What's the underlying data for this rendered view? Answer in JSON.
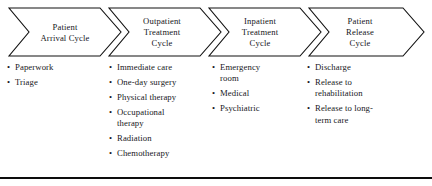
{
  "diagram": {
    "type": "process-chevron",
    "accent_color": "#111111",
    "background_color": "#ffffff",
    "stages": [
      {
        "id": "patient-arrival-cycle",
        "title_lines": [
          "Patient",
          "Arrival Cycle"
        ],
        "bullet_marker": "•",
        "items": [
          {
            "lines": [
              "Paperwork"
            ]
          },
          {
            "lines": [
              "Triage"
            ]
          }
        ]
      },
      {
        "id": "outpatient-treatment-cycle",
        "title_lines": [
          "Outpatient",
          "Treatment",
          "Cycle"
        ],
        "bullet_marker": "•",
        "items": [
          {
            "lines": [
              "Immediate care"
            ]
          },
          {
            "lines": [
              "One-day surgery"
            ]
          },
          {
            "lines": [
              "Physical therapy"
            ]
          },
          {
            "lines": [
              "Occupational",
              "therapy"
            ]
          },
          {
            "lines": [
              "Radiation"
            ]
          },
          {
            "lines": [
              "Chemotherapy"
            ]
          }
        ]
      },
      {
        "id": "inpatient-treatment-cycle",
        "title_lines": [
          "Inpatient",
          "Treatment",
          "Cycle"
        ],
        "bullet_marker": "•",
        "items": [
          {
            "lines": [
              "Emergency",
              "room"
            ]
          },
          {
            "lines": [
              "Medical"
            ]
          },
          {
            "lines": [
              "Psychiatric"
            ]
          }
        ]
      },
      {
        "id": "patient-release-cycle",
        "title_lines": [
          "Patient",
          "Release",
          "Cycle"
        ],
        "bullet_marker": "•",
        "items": [
          {
            "lines": [
              "Discharge"
            ]
          },
          {
            "lines": [
              "Release to",
              "rehabilitation"
            ]
          },
          {
            "lines": [
              "Release to long-",
              "term care"
            ]
          }
        ]
      }
    ]
  },
  "stage_titles": {
    "s1l1": "Patient",
    "s1l2": "Arrival Cycle",
    "s2l1": "Outpatient",
    "s2l2": "Treatment",
    "s2l3": "Cycle",
    "s3l1": "Inpatient",
    "s3l2": "Treatment",
    "s3l3": "Cycle",
    "s4l1": "Patient",
    "s4l2": "Release",
    "s4l3": "Cycle"
  },
  "bullets": {
    "marker": "•",
    "c1": [
      {
        "l1": "Paperwork",
        "l2": ""
      },
      {
        "l1": "Triage",
        "l2": ""
      }
    ],
    "c2": [
      {
        "l1": "Immediate care",
        "l2": ""
      },
      {
        "l1": "One-day surgery",
        "l2": ""
      },
      {
        "l1": "Physical therapy",
        "l2": ""
      },
      {
        "l1": "Occupational",
        "l2": "therapy"
      },
      {
        "l1": "Radiation",
        "l2": ""
      },
      {
        "l1": "Chemotherapy",
        "l2": ""
      }
    ],
    "c3": [
      {
        "l1": "Emergency",
        "l2": "room"
      },
      {
        "l1": "Medical",
        "l2": ""
      },
      {
        "l1": "Psychiatric",
        "l2": ""
      }
    ],
    "c4": [
      {
        "l1": "Discharge",
        "l2": ""
      },
      {
        "l1": "Release to",
        "l2": "rehabilitation"
      },
      {
        "l1": "Release to long-",
        "l2": "term care"
      }
    ]
  }
}
